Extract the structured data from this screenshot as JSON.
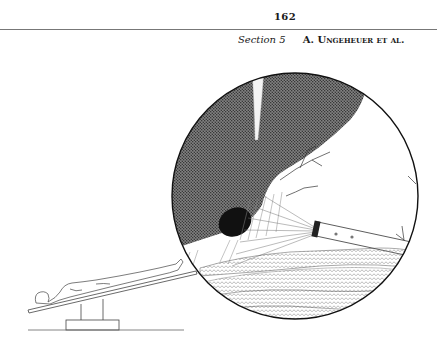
{
  "header": {
    "page_number": "162",
    "section_label": "Section 5",
    "authors": "A. Ungeheuer et al."
  },
  "figure": {
    "panels": [
      "patient-on-tilted-table",
      "laparoscopic-view-inset"
    ]
  }
}
